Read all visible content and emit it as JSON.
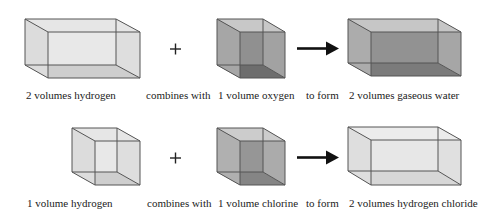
{
  "colors": {
    "edge": "#555555",
    "hydrogen": {
      "back": "#ececec",
      "side": "#dcdcdc",
      "top": "#e6e6e6",
      "bottom": "#c4c4c4",
      "front": "#e2e2e2"
    },
    "oxygen": {
      "back": "#8a8a8a",
      "side": "#a6a6a6",
      "top": "#c8c8c8",
      "bottom": "#555555",
      "front": "#9a9a9a"
    },
    "water": {
      "back": "#8e8e8e",
      "side": "#acacac",
      "top": "#c6c6c6",
      "bottom": "#6a6a6a",
      "front": "#9c9c9c"
    },
    "chlorine": {
      "back": "#909090",
      "side": "#b0b0b0",
      "top": "#cccccc",
      "bottom": "#767676",
      "front": "#a2a2a2"
    },
    "hydrogen_chloride": {
      "back": "#e8e8e8",
      "side": "#dedede",
      "top": "#ececec",
      "bottom": "#cfcfcf",
      "front": "#e4e4e4"
    },
    "arrow": "#111111",
    "text": "#222222"
  },
  "rows": [
    {
      "name": "water-reaction",
      "reactant1": {
        "label": "2 volumes hydrogen",
        "volumes": 2,
        "substance": "hydrogen"
      },
      "operator": "+",
      "connector1": "combines with",
      "reactant2": {
        "label": "1 volume oxygen",
        "volumes": 1,
        "substance": "oxygen"
      },
      "connector2": "to form",
      "product": {
        "label": "2 volumes gaseous water",
        "volumes": 2,
        "substance": "gaseous water"
      }
    },
    {
      "name": "hydrogen-chloride-reaction",
      "reactant1": {
        "label": "1 volume hydrogen",
        "volumes": 1,
        "substance": "hydrogen"
      },
      "operator": "+",
      "connector1": "combines with",
      "reactant2": {
        "label": "1 volume chlorine",
        "volumes": 1,
        "substance": "chlorine"
      },
      "connector2": "to form",
      "product": {
        "label": "2 volumes hydrogen chloride",
        "volumes": 2,
        "substance": "hydrogen chloride"
      }
    }
  ]
}
